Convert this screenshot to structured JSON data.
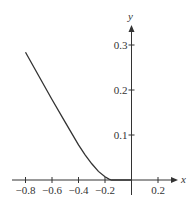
{
  "chart_data": {
    "type": "line",
    "title": "",
    "xlabel": "x",
    "ylabel": "y",
    "xlim": [
      -0.85,
      0.33
    ],
    "ylim": [
      0,
      0.33
    ],
    "grid": false,
    "legend": null,
    "x_ticks": [
      -0.8,
      -0.6,
      -0.4,
      -0.2,
      0.2
    ],
    "x_tick_labels": [
      "−0.8",
      "−0.6",
      "−0.4",
      "−0.2",
      "0.2"
    ],
    "y_ticks": [
      0.1,
      0.2,
      0.3
    ],
    "y_tick_labels": [
      "0.1",
      "0.2",
      "0.3"
    ],
    "series": [
      {
        "name": "curve",
        "color": "#333333",
        "x": [
          -0.8,
          -0.7,
          -0.6,
          -0.5,
          -0.4,
          -0.35,
          -0.3,
          -0.25,
          -0.2,
          -0.17,
          -0.15,
          -0.1,
          -0.05,
          0.0
        ],
        "y": [
          0.284,
          0.231,
          0.179,
          0.128,
          0.078,
          0.056,
          0.036,
          0.019,
          0.007,
          0.002,
          0.0,
          0.0,
          0.0,
          0.0
        ]
      }
    ]
  },
  "axes": {
    "x_label": "x",
    "y_label": "y",
    "x_ticks": [
      {
        "value": -0.8,
        "label": "−0.8"
      },
      {
        "value": -0.6,
        "label": "−0.6"
      },
      {
        "value": -0.4,
        "label": "−0.4"
      },
      {
        "value": -0.2,
        "label": "−0.2"
      },
      {
        "value": 0.2,
        "label": "0.2"
      }
    ],
    "y_ticks": [
      {
        "value": 0.1,
        "label": "0.1"
      },
      {
        "value": 0.2,
        "label": "0.2"
      },
      {
        "value": 0.3,
        "label": "0.3"
      }
    ]
  }
}
